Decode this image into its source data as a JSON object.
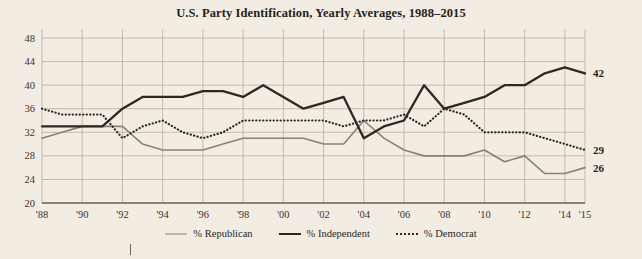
{
  "chart": {
    "title": "U.S. Party Identification, Yearly Averages, 1988–2015",
    "colors": {
      "background": "#f2ece3",
      "grid": "#b9ada2",
      "axis": "#6f655c",
      "republican": "#8d7f76",
      "independent": "#2e2823",
      "democrat": "#2e2823",
      "text": "#2b2622"
    }
  },
  "chart_data": {
    "type": "line",
    "title": "U.S. Party Identification, Yearly Averages, 1988–2015",
    "xlabel": "",
    "ylabel": "",
    "grid": true,
    "legend_position": "bottom",
    "ylim": [
      20,
      48
    ],
    "yticks": [
      20,
      24,
      28,
      32,
      36,
      40,
      44,
      48
    ],
    "ytick_labels": [
      "20",
      "24",
      "28",
      "32",
      "36",
      "40",
      "44",
      "48"
    ],
    "x": [
      1988,
      1989,
      1990,
      1991,
      1992,
      1993,
      1994,
      1995,
      1996,
      1997,
      1998,
      1999,
      2000,
      2001,
      2002,
      2003,
      2004,
      2005,
      2006,
      2007,
      2008,
      2009,
      2010,
      2011,
      2012,
      2013,
      2014,
      2015
    ],
    "xticks": [
      1988,
      1990,
      1992,
      1994,
      1996,
      1998,
      2000,
      2002,
      2004,
      2006,
      2008,
      2010,
      2012,
      2014,
      2015
    ],
    "xtick_labels": [
      "'88",
      "'90",
      "'92",
      "'94",
      "'96",
      "'98",
      "'00",
      "'02",
      "'04",
      "'06",
      "'08",
      "'10",
      "'12",
      "'14",
      "'15"
    ],
    "series": [
      {
        "name": "% Republican",
        "style": "solid-thin",
        "color": "#8d7f76",
        "end_label": "26",
        "values": [
          31,
          32,
          33,
          33,
          33,
          30,
          29,
          29,
          29,
          30,
          31,
          31,
          31,
          31,
          30,
          30,
          34,
          31,
          29,
          28,
          28,
          28,
          29,
          27,
          28,
          25,
          25,
          26
        ]
      },
      {
        "name": "% Independent",
        "style": "solid-thick",
        "color": "#2e2823",
        "end_label": "42",
        "values": [
          33,
          33,
          33,
          33,
          36,
          38,
          38,
          38,
          39,
          39,
          38,
          40,
          38,
          36,
          37,
          38,
          31,
          33,
          34,
          40,
          36,
          37,
          38,
          40,
          40,
          42,
          43,
          42
        ]
      },
      {
        "name": "% Democrat",
        "style": "dotted",
        "color": "#2e2823",
        "end_label": "29",
        "values": [
          36,
          35,
          35,
          35,
          31,
          33,
          34,
          32,
          31,
          32,
          34,
          34,
          34,
          34,
          34,
          33,
          34,
          34,
          35,
          33,
          36,
          35,
          32,
          32,
          32,
          31,
          30,
          29
        ]
      }
    ]
  },
  "legend": {
    "items": [
      {
        "label": "% Republican"
      },
      {
        "label": "% Independent"
      },
      {
        "label": "% Democrat"
      }
    ]
  }
}
